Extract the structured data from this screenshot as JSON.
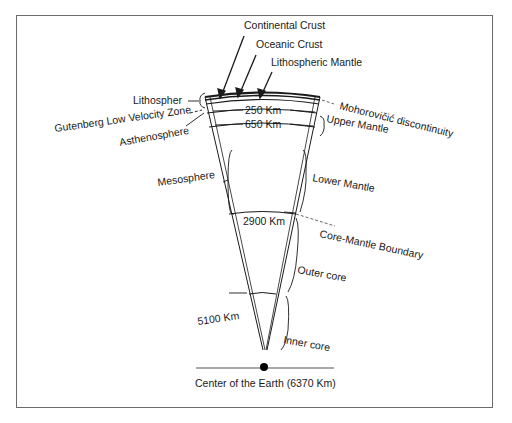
{
  "diagram": {
    "top_labels": {
      "continental_crust": "Continental Crust",
      "oceanic_crust": "Oceanic Crust",
      "lithospheric_mantle": "Lithospheric Mantle"
    },
    "left_labels": {
      "lithosphere": "Lithospher",
      "gutenberg": "Gutenberg Low Velocity Zone",
      "asthenosphere": "Asthenosphere",
      "mesosphere": "Mesosphere"
    },
    "right_labels": {
      "moho": "Mohorovičić discontinuity",
      "upper_mantle": "Upper Mantle",
      "lower_mantle": "Lower Mantle",
      "core_mantle_boundary": "Core-Mantle Boundary",
      "outer_core": "Outer core",
      "inner_core": "Inner core"
    },
    "depths": {
      "d250": "250 Km",
      "d650": "650 Km",
      "d2900": "2900 Km",
      "d5100": "5100 Km"
    },
    "center_label": "Center of the Earth (6370 Km)",
    "colors": {
      "line": "#1a1a1a",
      "frame": "#6b6b6b",
      "dashed": "#555555"
    }
  }
}
